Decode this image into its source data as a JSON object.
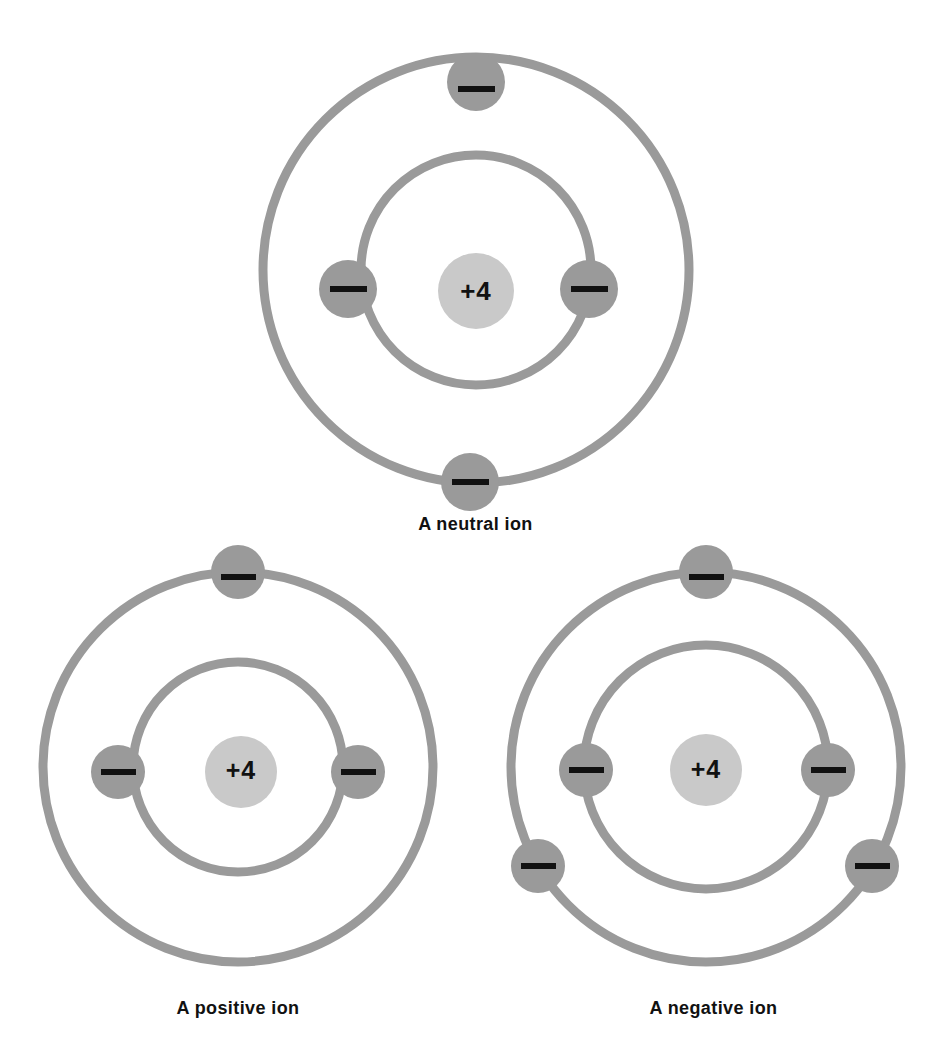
{
  "figure": {
    "background_color": "#ffffff",
    "shell_color": "#9a9a9a",
    "electron_color": "#9a9a9a",
    "nucleus_color": "#c9c9c9",
    "sign_color": "#111111",
    "label_color": "#111111"
  },
  "diagrams": [
    {
      "id": "neutral-ion",
      "caption": "A neutral ion",
      "nucleus_label": "+4",
      "nucleus_charge": 4,
      "electron_count": 4,
      "shells": [
        {
          "name": "inner-shell",
          "radius": 115,
          "electron_count": 2
        },
        {
          "name": "outer-shell",
          "radius": 213,
          "electron_count": 2
        }
      ],
      "electrons": [
        {
          "label": "—",
          "shell": "outer-shell",
          "position": "top"
        },
        {
          "label": "—",
          "shell": "inner-shell",
          "position": "left"
        },
        {
          "label": "—",
          "shell": "inner-shell",
          "position": "right"
        },
        {
          "label": "—",
          "shell": "outer-shell",
          "position": "bottom"
        }
      ]
    },
    {
      "id": "positive-ion",
      "caption": "A positive ion",
      "nucleus_label": "+4",
      "nucleus_charge": 4,
      "electron_count": 3,
      "shells": [
        {
          "name": "inner-shell",
          "radius": 105,
          "electron_count": 2
        },
        {
          "name": "outer-shell",
          "radius": 195,
          "electron_count": 1
        }
      ],
      "electrons": [
        {
          "label": "—",
          "shell": "outer-shell",
          "position": "top"
        },
        {
          "label": "—",
          "shell": "inner-shell",
          "position": "left"
        },
        {
          "label": "—",
          "shell": "inner-shell",
          "position": "right"
        }
      ]
    },
    {
      "id": "negative-ion",
      "caption": "A negative ion",
      "nucleus_label": "+4",
      "nucleus_charge": 4,
      "electron_count": 5,
      "shells": [
        {
          "name": "inner-shell",
          "radius": 122,
          "electron_count": 2
        },
        {
          "name": "outer-shell",
          "radius": 195,
          "electron_count": 3
        }
      ],
      "electrons": [
        {
          "label": "—",
          "shell": "outer-shell",
          "position": "top"
        },
        {
          "label": "—",
          "shell": "inner-shell",
          "position": "left"
        },
        {
          "label": "—",
          "shell": "inner-shell",
          "position": "right"
        },
        {
          "label": "—",
          "shell": "outer-shell",
          "position": "lower-left"
        },
        {
          "label": "—",
          "shell": "outer-shell",
          "position": "lower-right"
        }
      ]
    }
  ]
}
